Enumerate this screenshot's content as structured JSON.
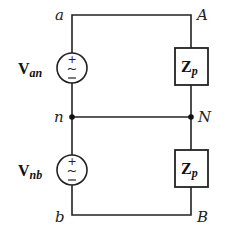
{
  "diagram": {
    "type": "circuit",
    "nodes": {
      "a": "a",
      "A": "A",
      "n": "n",
      "N": "N",
      "b": "b",
      "B": "B"
    },
    "sources": [
      {
        "id": "source-an",
        "symbol": "V",
        "subscript": "an",
        "plus": "+",
        "minus": "−",
        "tilde": "~"
      },
      {
        "id": "source-nb",
        "symbol": "V",
        "subscript": "nb",
        "plus": "+",
        "minus": "−",
        "tilde": "~"
      }
    ],
    "loads": [
      {
        "id": "load-top",
        "symbol": "Z",
        "subscript": "p"
      },
      {
        "id": "load-bottom",
        "symbol": "Z",
        "subscript": "p"
      }
    ],
    "colors": {
      "wire": "#222222",
      "background": "#ffffff"
    }
  }
}
